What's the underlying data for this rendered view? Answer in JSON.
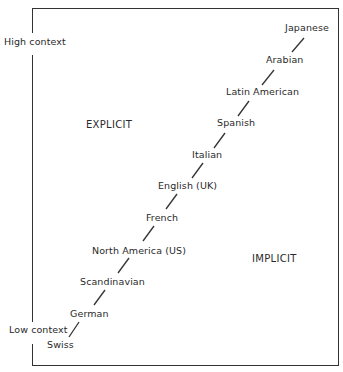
{
  "diagram": {
    "axis": {
      "high_label": "High context",
      "low_label": "Low context"
    },
    "regions": {
      "explicit": "EXPLICIT",
      "implicit": "IMPLICIT"
    },
    "cultures": [
      {
        "name": "Japanese"
      },
      {
        "name": "Arabian"
      },
      {
        "name": "Latin American"
      },
      {
        "name": "Spanish"
      },
      {
        "name": "Italian"
      },
      {
        "name": "English (UK)"
      },
      {
        "name": "French"
      },
      {
        "name": "North America (US)"
      },
      {
        "name": "Scandinavian"
      },
      {
        "name": "German"
      },
      {
        "name": "Swiss"
      }
    ]
  }
}
